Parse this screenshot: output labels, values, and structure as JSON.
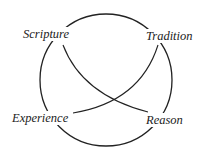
{
  "diagram": {
    "type": "quadrilateral",
    "nodes": [
      {
        "id": "scripture",
        "label": "Scripture"
      },
      {
        "id": "tradition",
        "label": "Tradition"
      },
      {
        "id": "experience",
        "label": "Experience"
      },
      {
        "id": "reason",
        "label": "Reason"
      }
    ],
    "edges": [
      {
        "from": "scripture",
        "to": "reason",
        "style": "curve"
      },
      {
        "from": "tradition",
        "to": "experience",
        "style": "curve"
      }
    ],
    "stroke_color": "#222222"
  }
}
